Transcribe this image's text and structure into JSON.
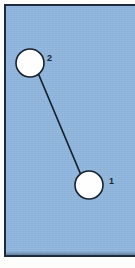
{
  "figure": {
    "canvas": {
      "width": 135,
      "height": 268
    },
    "panel": {
      "fill_color": "#8eb4dc",
      "border_color": "#1b2a3c",
      "border_width_px": 2,
      "x": 4,
      "y": 4,
      "width": 131,
      "height": 253
    }
  },
  "chart_data": {
    "type": "scatter",
    "title": "",
    "xlabel": "",
    "ylabel": "",
    "grid": false,
    "legend": null,
    "xlim": [
      0,
      135
    ],
    "ylim": [
      268,
      0
    ],
    "node_style": {
      "fill": "#fefefe",
      "stroke": "#16222f",
      "stroke_width": 1.6,
      "radius": 14
    },
    "edge_style": {
      "stroke": "#16222f",
      "stroke_width": 1.6
    },
    "nodes": [
      {
        "id": "node-1",
        "label": "1",
        "cx": 93,
        "cy": 189,
        "r": 14,
        "label_x": 113,
        "label_y": 186
      },
      {
        "id": "node-2",
        "label": "2",
        "cx": 34,
        "cy": 67,
        "r": 14,
        "label_x": 51,
        "label_y": 63
      }
    ],
    "edges": [
      {
        "id": "edge-2-1",
        "from": "node-2",
        "to": "node-1",
        "x1": 42.5,
        "y1": 78.1,
        "x2": 84.5,
        "y2": 177.9
      }
    ]
  }
}
